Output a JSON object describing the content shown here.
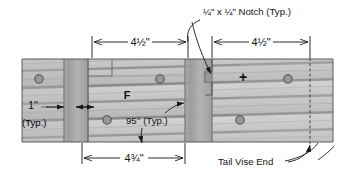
{
  "figure": {
    "width": 351,
    "height": 178,
    "background_color": "#ffffff",
    "line_color": "#171717"
  },
  "dimensions": [
    {
      "id": "top-left-span",
      "label": "4½\"",
      "position": "top-left",
      "x_start": 92,
      "x_end": 188,
      "y": 42,
      "text_x": 140,
      "text_y": 39
    },
    {
      "id": "top-right-span",
      "label": "4½\"",
      "position": "top-right",
      "x_start": 212,
      "x_end": 310,
      "y": 42,
      "text_x": 261,
      "text_y": 39
    },
    {
      "id": "bottom-span",
      "label": "4¾\"",
      "position": "bottom-center",
      "x_start": 82,
      "x_end": 185,
      "y": 158,
      "text_x": 134,
      "text_y": 155
    }
  ],
  "callouts": [
    {
      "id": "notch-callout",
      "label": "¼\" x ¼\" Notch (Typ.)",
      "text_x": 203,
      "text_y": 15,
      "anchor": "start"
    },
    {
      "id": "tail-vise-callout",
      "label": "Tail Vise End",
      "text_x": 218,
      "text_y": 165,
      "anchor": "start"
    },
    {
      "id": "angle-callout",
      "label": "95° (Typ.)",
      "text_x": 126,
      "text_y": 124,
      "anchor": "start"
    }
  ],
  "notes": [
    {
      "id": "thickness-note-value",
      "label": "1\"",
      "text_x": 28,
      "text_y": 109
    },
    {
      "id": "thickness-note-typ",
      "label": "(Typ.)",
      "text_x": 22,
      "text_y": 126
    }
  ],
  "marks": [
    {
      "id": "face-mark",
      "label": "F",
      "text_x": 127,
      "text_y": 99
    },
    {
      "id": "plus-mark",
      "label": "+",
      "text_x": 243,
      "text_y": 82
    }
  ],
  "dowels": [
    {
      "id": "dowel-1",
      "cx": 39,
      "cy": 79,
      "r": 4.2
    },
    {
      "id": "dowel-2",
      "cx": 160,
      "cy": 79,
      "r": 4.2
    },
    {
      "id": "dowel-3",
      "cx": 288,
      "cy": 79,
      "r": 4.2
    },
    {
      "id": "dowel-4",
      "cx": 107,
      "cy": 120,
      "r": 4.2
    },
    {
      "id": "dowel-5",
      "cx": 240,
      "cy": 120,
      "r": 4.2
    }
  ],
  "board": {
    "left": 22,
    "right": 333,
    "top": 59,
    "bottom": 142,
    "base_color": "#c9c9c9"
  },
  "tail_vise_line": {
    "x": 310,
    "y_top": 58,
    "y_bottom": 150
  },
  "colors": {
    "strip_light": "#d6d6d6",
    "strip_mid": "#c3c3c3",
    "strip_dark": "#a8a8a8",
    "band_dark": "#9c9c9c",
    "glue_line": "#7c7c7c",
    "outline": "#4a4a4a",
    "ink": "#171717"
  }
}
